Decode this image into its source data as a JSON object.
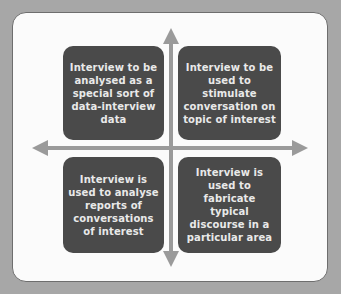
{
  "diagram": {
    "type": "quadrant",
    "colors": {
      "background": "#a7a7a7",
      "card": "#fbfbfb",
      "box": "#4a4a4a",
      "box_text": "#e9e9e9",
      "arrow": "#9a9a9a"
    },
    "quadrants": {
      "top_left": "Interview to be analysed as a special sort of data-interview data",
      "top_right": "Interview to be used to stimulate conversation on topic of interest",
      "bottom_left": "Interview is used to analyse reports of conversations of interest",
      "bottom_right": "Interview is used to fabricate typical discourse in a particular area"
    },
    "axes": {
      "vertical": "double-headed-arrow",
      "horizontal": "double-headed-arrow"
    }
  }
}
